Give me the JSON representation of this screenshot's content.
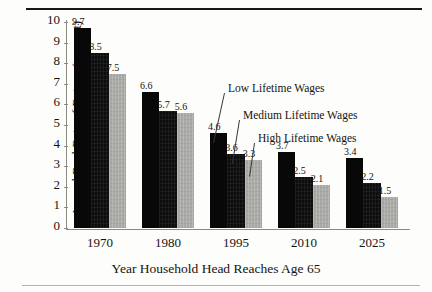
{
  "chart_data": {
    "type": "bar",
    "title": "",
    "xlabel": "Year Household Head Reaches Age 65",
    "ylabel": "Annual Real Rate of Return (percent)",
    "categories": [
      "1970",
      "1980",
      "1995",
      "2010",
      "2025"
    ],
    "series": [
      {
        "name": "Low Lifetime Wages",
        "values": [
          9.7,
          6.6,
          4.6,
          3.7,
          3.4
        ],
        "color": "#080808"
      },
      {
        "name": "Medium Lifetime Wages",
        "values": [
          8.5,
          5.7,
          3.6,
          2.5,
          2.2
        ],
        "color": "#0d0d0d"
      },
      {
        "name": "High Lifetime Wages",
        "values": [
          7.5,
          5.6,
          3.3,
          2.1,
          1.5
        ],
        "color": "#a9a9a6"
      }
    ],
    "ylim": [
      0,
      10
    ],
    "yticks": [
      "0",
      "1",
      "2",
      "3",
      "4",
      "5",
      "6",
      "7",
      "8",
      "9",
      "10"
    ],
    "grid": false,
    "legend_position": "inline-annotations-with-leader-lines",
    "annotations": [
      {
        "text": "Low Lifetime Wages",
        "points_to": "1995 Low Lifetime Wages bar"
      },
      {
        "text": "Medium Lifetime Wages",
        "points_to": "1995 Medium Lifetime Wages bar"
      },
      {
        "text": "High Lifetime Wages",
        "points_to": "1995 High Lifetime Wages bar"
      }
    ],
    "value_labels": [
      [
        "9.7",
        "8.5",
        "7.5"
      ],
      [
        "6.6",
        "5.7",
        "5.6"
      ],
      [
        "4.6",
        "3.6",
        "3.3"
      ],
      [
        "3.7",
        "2.5",
        "2.1"
      ],
      [
        "3.4",
        "2.2",
        "1.5"
      ]
    ]
  }
}
